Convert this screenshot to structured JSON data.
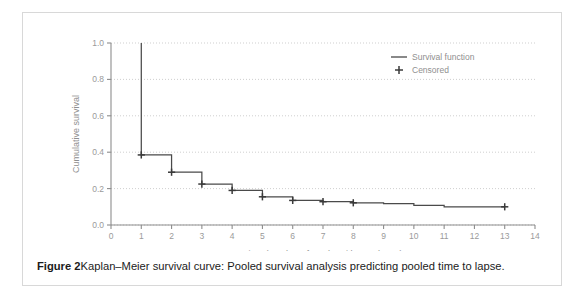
{
  "figure": {
    "caption_label": "Figure 2",
    "caption_text": "Kaplan–Meier survival curve: Pooled survival analysis predicting pooled time to lapse."
  },
  "legend": {
    "position": "top-right",
    "entries": [
      {
        "label": "Survival function",
        "marker": "line-marker"
      },
      {
        "label": "Censored",
        "marker": "plus-marker"
      }
    ]
  },
  "chart_data": {
    "type": "line",
    "title": "",
    "subtitle": "",
    "xlabel": "Time (number of weeks without a lapse)",
    "ylabel": "Cumulative survival",
    "xlim": [
      0,
      14
    ],
    "ylim": [
      0.0,
      1.0
    ],
    "xticks": [
      0,
      1,
      2,
      3,
      4,
      5,
      6,
      7,
      8,
      9,
      10,
      11,
      12,
      13,
      14
    ],
    "xtick_labels": [
      "0",
      "1",
      "2",
      "3",
      "4",
      "5",
      "6",
      "7",
      "8",
      "9",
      "10",
      "11",
      "12",
      "13",
      "14"
    ],
    "yticks": [
      0.0,
      0.2,
      0.4,
      0.6,
      0.8,
      1.0
    ],
    "ytick_labels": [
      "0.0",
      "0.2",
      "0.4",
      "0.6",
      "0.8",
      "1.0"
    ],
    "grid": "horizontal-dotted",
    "line_color": "#4a4a4a",
    "marker_color": "#3a3a3a",
    "series": [
      {
        "name": "Survival function",
        "style": "step-post",
        "x": [
          1,
          1,
          2,
          2,
          3,
          3,
          4,
          4,
          5,
          5,
          6,
          6,
          7,
          7,
          8,
          8,
          9,
          9,
          10,
          10,
          11,
          11,
          13
        ],
        "y": [
          1.0,
          0.385,
          0.385,
          0.29,
          0.29,
          0.225,
          0.225,
          0.19,
          0.19,
          0.155,
          0.155,
          0.135,
          0.135,
          0.128,
          0.128,
          0.122,
          0.122,
          0.118,
          0.118,
          0.108,
          0.108,
          0.1,
          0.1
        ]
      },
      {
        "name": "Censored",
        "style": "markers",
        "x": [
          1,
          2,
          3,
          4,
          5,
          6,
          7,
          8,
          13
        ],
        "y": [
          0.385,
          0.29,
          0.225,
          0.19,
          0.155,
          0.135,
          0.128,
          0.122,
          0.1
        ]
      }
    ]
  }
}
